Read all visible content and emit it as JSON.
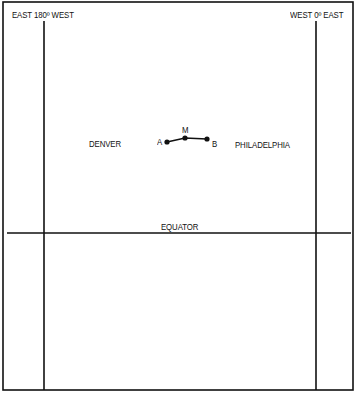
{
  "diagram": {
    "meridians": {
      "left_label": "EAST 180º WEST",
      "right_label": "WEST 0º EAST"
    },
    "equator_label": "EQUATOR",
    "cities": {
      "west": "DENVER",
      "east": "PHILADELPHIA"
    },
    "points": [
      {
        "label": "A",
        "x": 167,
        "y": 142
      },
      {
        "label": "M",
        "x": 185,
        "y": 138
      },
      {
        "label": "B",
        "x": 207,
        "y": 139
      }
    ],
    "colors": {
      "line": "#111111",
      "background": "#ffffff"
    }
  }
}
